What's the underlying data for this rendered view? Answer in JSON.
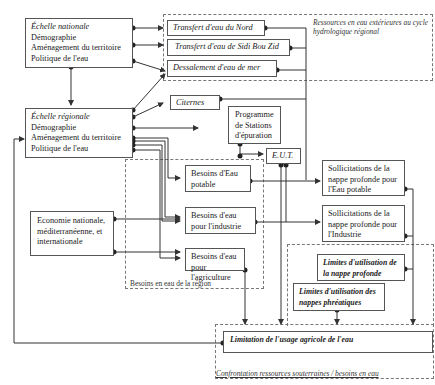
{
  "diagram": {
    "national": {
      "title": "Échelle nationale",
      "lines": [
        "Démographie",
        "Aménagement du territoire",
        "Politique de l'eau"
      ]
    },
    "regional": {
      "title": "Échelle régionale",
      "lines": [
        "Démographie",
        "Aménagement du territoire",
        "Politique de l'eau"
      ]
    },
    "external_resources": {
      "group_label": "Ressources en eau extérieures au cycle hydrologique régional",
      "items": [
        "Transfert d'eau du Nord",
        "Transfert d'eau de Sidi Bou Zid",
        "Dessalement d'eau de mer"
      ]
    },
    "citernes": "Citernes",
    "programme": "Programme de Stations d'épuration",
    "eut": "E.U.T.",
    "needs": {
      "group_label": "Besoins en eau de la région",
      "potable": "Besoins d'Eau potable",
      "industrie": "Besoins d'eau pour l'industrie",
      "agriculture": "Besoins d'eau pour l'agriculture"
    },
    "economy": "Economie nationale, méditerranéenne, et internationale",
    "sollicitations": {
      "potable": "Sollicitations de la nappe profonde pour l'Eau potable",
      "industrie": "Sollicitations de la nappe profonde pour l'Industrie"
    },
    "limits": {
      "profonde": "Limites d'utilisation de la nappe profonde",
      "phreatiques": "Limites d'utilisation des nappes phréatiques"
    },
    "limitation": "Limitation de l'usage agricole de l'eau",
    "confrontation_label": "Confrontation ressources souterraines / besoins en eau"
  }
}
